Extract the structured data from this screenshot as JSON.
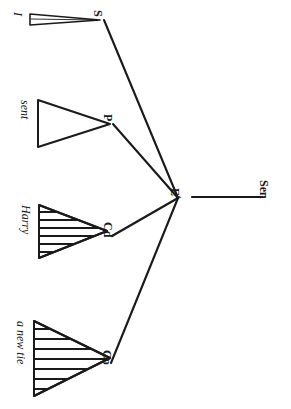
{
  "figure": {
    "orientation": "rotated-90-ccw",
    "background_color": "#ffffff",
    "ink_color": "#1a1a1a",
    "sentence": "I sent Harry a new tie"
  },
  "nodes": {
    "root": {
      "label": "E",
      "superscript": "t",
      "name": "node-e-t"
    },
    "sen": {
      "label": "Sen",
      "name": "node-sen"
    },
    "s": {
      "label": "S",
      "name": "node-s"
    },
    "p": {
      "label": "P",
      "name": "node-p"
    },
    "cd": {
      "label": "Cd",
      "name": "node-cd"
    },
    "co": {
      "label": "Co",
      "name": "node-co"
    }
  },
  "terminals": [
    {
      "key": "i",
      "text": "I",
      "parent": "S",
      "hatched": false,
      "sliver": true
    },
    {
      "key": "sent",
      "text": "sent",
      "parent": "P",
      "hatched": false,
      "sliver": false
    },
    {
      "key": "harry",
      "text": "Harry",
      "parent": "Cd",
      "hatched": true,
      "sliver": false
    },
    {
      "key": "a_new_tie",
      "text": "a new tie",
      "parent": "Co",
      "hatched": true,
      "sliver": false
    }
  ],
  "edges": [
    {
      "from": "E",
      "to": "S",
      "name": "edge-e-s"
    },
    {
      "from": "E",
      "to": "P",
      "name": "edge-e-p"
    },
    {
      "from": "E",
      "to": "Cd",
      "name": "edge-e-cd"
    },
    {
      "from": "E",
      "to": "Co",
      "name": "edge-e-co"
    },
    {
      "from": "E",
      "to": "Sen",
      "name": "edge-e-sen"
    }
  ]
}
